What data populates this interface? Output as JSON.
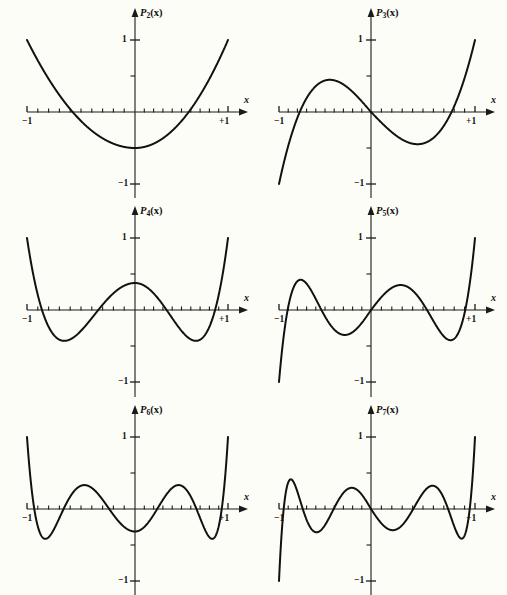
{
  "figure": {
    "background_color": "#fdfdf7",
    "curve_color": "#111111",
    "axis_color": "#1a1a1a",
    "rows": 3,
    "cols": 2
  },
  "axis_labels": {
    "x_axis": "x",
    "y_top": "1",
    "y_bottom": "−1",
    "x_left": "−1",
    "x_right": "+1"
  },
  "panels": [
    {
      "id": "p2",
      "name": "legendre-p2",
      "label_base": "P",
      "label_sub": "2",
      "label_args": "(x)",
      "degree": 2
    },
    {
      "id": "p3",
      "name": "legendre-p3",
      "label_base": "P",
      "label_sub": "3",
      "label_args": "(x)",
      "degree": 3
    },
    {
      "id": "p4",
      "name": "legendre-p4",
      "label_base": "P",
      "label_sub": "4",
      "label_args": "(x)",
      "degree": 4
    },
    {
      "id": "p5",
      "name": "legendre-p5",
      "label_base": "P",
      "label_sub": "5",
      "label_args": "(x)",
      "degree": 5
    },
    {
      "id": "p6",
      "name": "legendre-p6",
      "label_base": "P",
      "label_sub": "6",
      "label_args": "(x)",
      "degree": 6
    },
    {
      "id": "p7",
      "name": "legendre-p7",
      "label_base": "P",
      "label_sub": "7",
      "label_args": "(x)",
      "degree": 7
    }
  ],
  "chart_data": [
    {
      "type": "line",
      "title": "P_2(x)",
      "xlabel": "x",
      "ylabel": "P_2(x)",
      "xlim": [
        -1,
        1
      ],
      "ylim": [
        -1,
        1
      ],
      "grid": false,
      "legend": "none",
      "x_ticks": [
        -1,
        -0.9,
        -0.8,
        -0.7,
        -0.6,
        -0.5,
        -0.4,
        -0.3,
        -0.2,
        -0.1,
        0,
        0.1,
        0.2,
        0.3,
        0.4,
        0.5,
        0.6,
        0.7,
        0.8,
        0.9,
        1
      ],
      "x_tick_labels": {
        "-1": "−1",
        "1": "+1"
      },
      "y_ticks": [
        -1,
        -0.5,
        0.5,
        1
      ],
      "y_tick_labels": {
        "-1": "−1",
        "1": "1"
      },
      "series": [
        {
          "name": "P2",
          "degree": 2,
          "x": [
            -1,
            -0.9,
            -0.8,
            -0.7,
            -0.6,
            -0.5,
            -0.4,
            -0.3,
            -0.2,
            -0.1,
            0,
            0.1,
            0.2,
            0.3,
            0.4,
            0.5,
            0.6,
            0.7,
            0.8,
            0.9,
            1
          ],
          "values": [
            1,
            0.715,
            0.46,
            0.235,
            0.04,
            -0.125,
            -0.26,
            -0.365,
            -0.44,
            -0.485,
            -0.5,
            -0.485,
            -0.44,
            -0.365,
            -0.26,
            -0.125,
            0.04,
            0.235,
            0.46,
            0.715,
            1
          ],
          "roots": [
            -0.5774,
            0.5774
          ],
          "value_at_zero": -0.5
        }
      ]
    },
    {
      "type": "line",
      "title": "P_3(x)",
      "xlabel": "x",
      "ylabel": "P_3(x)",
      "xlim": [
        -1,
        1
      ],
      "ylim": [
        -1,
        1
      ],
      "grid": false,
      "legend": "none",
      "x_ticks": [
        -1,
        -0.9,
        -0.8,
        -0.7,
        -0.6,
        -0.5,
        -0.4,
        -0.3,
        -0.2,
        -0.1,
        0,
        0.1,
        0.2,
        0.3,
        0.4,
        0.5,
        0.6,
        0.7,
        0.8,
        0.9,
        1
      ],
      "x_tick_labels": {
        "-1": "−1",
        "1": "+1"
      },
      "y_ticks": [
        -1,
        -0.5,
        0.5,
        1
      ],
      "y_tick_labels": {
        "-1": "−1",
        "1": "1"
      },
      "series": [
        {
          "name": "P3",
          "degree": 3,
          "x": [
            -1,
            -0.9,
            -0.8,
            -0.7,
            -0.6,
            -0.5,
            -0.4,
            -0.3,
            -0.2,
            -0.1,
            0,
            0.1,
            0.2,
            0.3,
            0.4,
            0.5,
            0.6,
            0.7,
            0.8,
            0.9,
            1
          ],
          "values": [
            -1,
            -0.4725,
            -0.08,
            0.1925,
            0.36,
            0.4375,
            0.44,
            0.3825,
            0.28,
            0.1475,
            0,
            -0.1475,
            -0.28,
            -0.3825,
            -0.44,
            -0.4375,
            -0.36,
            -0.1925,
            0.08,
            0.4725,
            1
          ],
          "roots": [
            -0.7746,
            0,
            0.7746
          ],
          "value_at_zero": 0
        }
      ]
    },
    {
      "type": "line",
      "title": "P_4(x)",
      "xlabel": "x",
      "ylabel": "P_4(x)",
      "xlim": [
        -1,
        1
      ],
      "ylim": [
        -1,
        1
      ],
      "grid": false,
      "legend": "none",
      "x_ticks": [
        -1,
        -0.9,
        -0.8,
        -0.7,
        -0.6,
        -0.5,
        -0.4,
        -0.3,
        -0.2,
        -0.1,
        0,
        0.1,
        0.2,
        0.3,
        0.4,
        0.5,
        0.6,
        0.7,
        0.8,
        0.9,
        1
      ],
      "x_tick_labels": {
        "-1": "−1",
        "1": "+1"
      },
      "y_ticks": [
        -1,
        -0.5,
        0.5,
        1
      ],
      "y_tick_labels": {
        "-1": "−1",
        "1": "1"
      },
      "series": [
        {
          "name": "P4",
          "degree": 4,
          "x": [
            -1,
            -0.9,
            -0.8,
            -0.7,
            -0.6,
            -0.5,
            -0.4,
            -0.3,
            -0.2,
            -0.1,
            0,
            0.1,
            0.2,
            0.3,
            0.4,
            0.5,
            0.6,
            0.7,
            0.8,
            0.9,
            1
          ],
          "values": [
            1,
            0.2079,
            -0.233,
            -0.4121,
            -0.408,
            -0.2891,
            -0.113,
            0.0729,
            0.232,
            0.3427,
            0.375,
            0.3427,
            0.232,
            0.0729,
            -0.113,
            -0.2891,
            -0.408,
            -0.4121,
            -0.233,
            0.2079,
            1
          ],
          "roots": [
            -0.8611,
            -0.34,
            0.34,
            0.8611
          ],
          "value_at_zero": 0.375
        }
      ]
    },
    {
      "type": "line",
      "title": "P_5(x)",
      "xlabel": "x",
      "ylabel": "P_5(x)",
      "xlim": [
        -1,
        1
      ],
      "ylim": [
        -1,
        1
      ],
      "grid": false,
      "legend": "none",
      "x_ticks": [
        -1,
        -0.9,
        -0.8,
        -0.7,
        -0.6,
        -0.5,
        -0.4,
        -0.3,
        -0.2,
        -0.1,
        0,
        0.1,
        0.2,
        0.3,
        0.4,
        0.5,
        0.6,
        0.7,
        0.8,
        0.9,
        1
      ],
      "x_tick_labels": {
        "-1": "−1",
        "1": "+1"
      },
      "y_ticks": [
        -1,
        -0.5,
        0.5,
        1
      ],
      "y_tick_labels": {
        "-1": "−1",
        "1": "1"
      },
      "series": [
        {
          "name": "P5",
          "degree": 5,
          "x": [
            -1,
            -0.9,
            -0.8,
            -0.7,
            -0.6,
            -0.5,
            -0.4,
            -0.3,
            -0.2,
            -0.1,
            0,
            0.1,
            0.2,
            0.3,
            0.4,
            0.5,
            0.6,
            0.7,
            0.8,
            0.9,
            1
          ],
          "values": [
            -1,
            0.0411,
            0.3995,
            0.3652,
            0.1526,
            -0.0898,
            -0.2706,
            -0.3454,
            -0.3075,
            -0.1788,
            0,
            0.1788,
            0.3075,
            0.3454,
            0.2706,
            0.0898,
            -0.1526,
            -0.3652,
            -0.3995,
            -0.0411,
            1
          ],
          "roots": [
            -0.9062,
            -0.5385,
            0,
            0.5385,
            0.9062
          ],
          "value_at_zero": 0
        }
      ]
    },
    {
      "type": "line",
      "title": "P_6(x)",
      "xlabel": "x",
      "ylabel": "P_6(x)",
      "xlim": [
        -1,
        1
      ],
      "ylim": [
        -1,
        1
      ],
      "grid": false,
      "legend": "none",
      "x_ticks": [
        -1,
        -0.9,
        -0.8,
        -0.7,
        -0.6,
        -0.5,
        -0.4,
        -0.3,
        -0.2,
        -0.1,
        0,
        0.1,
        0.2,
        0.3,
        0.4,
        0.5,
        0.6,
        0.7,
        0.8,
        0.9,
        1
      ],
      "x_tick_labels": {
        "-1": "−1",
        "1": "+1"
      },
      "y_ticks": [
        -1,
        -0.5,
        0.5,
        1
      ],
      "y_tick_labels": {
        "-1": "−1",
        "1": "1"
      },
      "series": [
        {
          "name": "P6",
          "degree": 6,
          "x": [
            -1,
            -0.9,
            -0.8,
            -0.7,
            -0.6,
            -0.5,
            -0.4,
            -0.3,
            -0.2,
            -0.1,
            0,
            0.1,
            0.2,
            0.3,
            0.4,
            0.5,
            0.6,
            0.7,
            0.8,
            0.9,
            1
          ],
          "values": [
            1,
            -0.1038,
            -0.2412,
            0.0719,
            0.3041,
            0.3232,
            0.1721,
            -0.0366,
            -0.1995,
            -0.2882,
            -0.3125,
            -0.2882,
            -0.1995,
            -0.0366,
            0.1721,
            0.3232,
            0.3041,
            0.0719,
            -0.2412,
            -0.1038,
            1
          ],
          "roots": [
            -0.9325,
            -0.6612,
            -0.2386,
            0.2386,
            0.6612,
            0.9325
          ],
          "value_at_zero": -0.3125
        }
      ]
    },
    {
      "type": "line",
      "title": "P_7(x)",
      "xlabel": "x",
      "ylabel": "P_7(x)",
      "xlim": [
        -1,
        1
      ],
      "ylim": [
        -1,
        1
      ],
      "grid": false,
      "legend": "none",
      "x_ticks": [
        -1,
        -0.9,
        -0.8,
        -0.7,
        -0.6,
        -0.5,
        -0.4,
        -0.3,
        -0.2,
        -0.1,
        0,
        0.1,
        0.2,
        0.3,
        0.4,
        0.5,
        0.6,
        0.7,
        0.8,
        0.9,
        1
      ],
      "x_tick_labels": {
        "-1": "−1",
        "1": "+1"
      },
      "y_ticks": [
        -1,
        -0.5,
        0.5,
        1
      ],
      "y_tick_labels": {
        "-1": "−1",
        "1": "1"
      },
      "series": [
        {
          "name": "P7",
          "degree": 7,
          "x": [
            -1,
            -0.9,
            -0.8,
            -0.7,
            -0.6,
            -0.5,
            -0.4,
            -0.3,
            -0.2,
            -0.1,
            0,
            0.1,
            0.2,
            0.3,
            0.4,
            0.5,
            0.6,
            0.7,
            0.8,
            0.9,
            1
          ],
          "values": [
            -1,
            0.2519,
            0.0226,
            -0.273,
            -0.1253,
            0.2231,
            0.2737,
            0.0027,
            -0.2397,
            -0.2447,
            0,
            0.2447,
            0.2397,
            -0.0027,
            -0.2737,
            -0.2231,
            0.1253,
            0.273,
            -0.0226,
            -0.2519,
            1
          ],
          "roots": [
            -0.9491,
            -0.7415,
            -0.4058,
            0,
            0.4058,
            0.7415,
            0.9491
          ],
          "value_at_zero": 0
        }
      ]
    }
  ]
}
